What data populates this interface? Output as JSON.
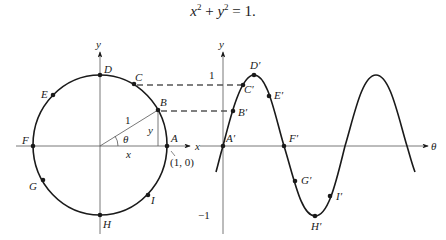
{
  "equation": {
    "x": "x",
    "exp1": "2",
    "plus": " + ",
    "y": "y",
    "exp2": "2",
    "equals": " = 1."
  },
  "unit_circle": {
    "axis_x_label": "x",
    "axis_y_label": "y",
    "radius_label": "1",
    "angle_label": "θ",
    "leg_x_label": "x",
    "leg_y_label": "y",
    "point_A_coords": "(1, 0)",
    "points": [
      {
        "name": "A",
        "angle_deg": 0
      },
      {
        "name": "B",
        "angle_deg": 30
      },
      {
        "name": "C",
        "angle_deg": 60
      },
      {
        "name": "D",
        "angle_deg": 90
      },
      {
        "name": "E",
        "angle_deg": 135
      },
      {
        "name": "F",
        "angle_deg": 180
      },
      {
        "name": "G",
        "angle_deg": 225
      },
      {
        "name": "H",
        "angle_deg": 270
      },
      {
        "name": "I",
        "angle_deg": 300
      }
    ],
    "labels": {
      "A": "A",
      "B": "B",
      "C": "C",
      "D": "D",
      "E": "E",
      "F": "F",
      "G": "G",
      "H": "H",
      "I": "I"
    }
  },
  "sine_graph": {
    "axis_x_label": "θ",
    "axis_y_label": "y",
    "tick_1": "1",
    "tick_neg1": "−1",
    "labels": {
      "A": "A′",
      "B": "B′",
      "C": "C′",
      "D": "D′",
      "E": "E′",
      "F": "F′",
      "G": "G′",
      "H": "H′",
      "I": "I′"
    }
  }
}
